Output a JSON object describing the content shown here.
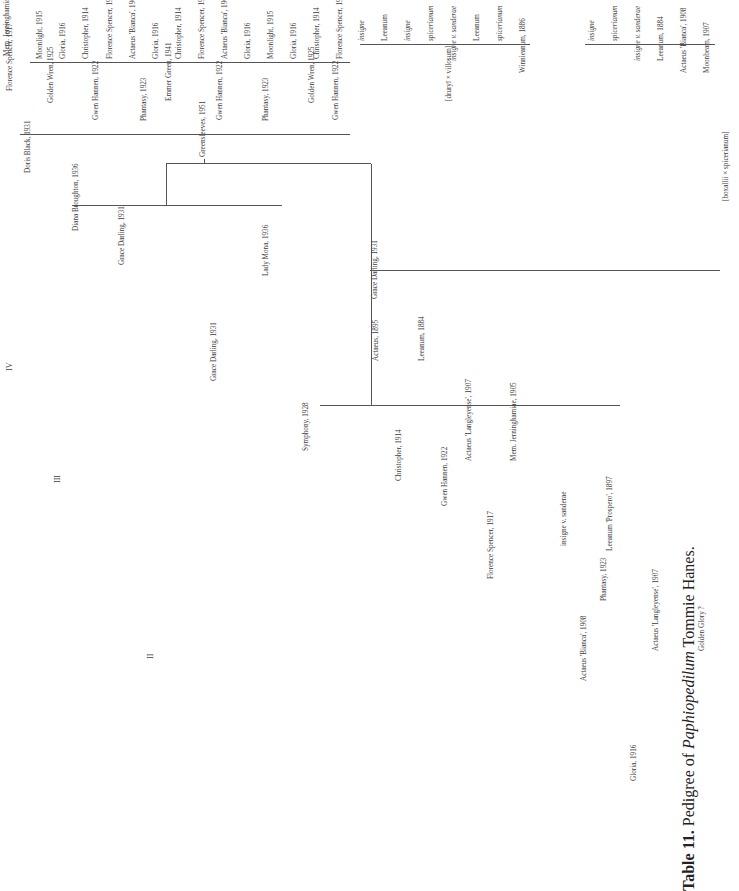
{
  "caption": {
    "label": "Table 11.",
    "text_prefix": "Pedigree of",
    "genus": "Paphiopedilum",
    "cultivar": "Tommie Hanes."
  },
  "generation_labels": [
    "II",
    "III",
    "IV"
  ],
  "tree": {
    "root": "Greensleeves, 1951",
    "gen2": [
      "Emmer Green, 1941",
      "Grace Darling, 1931"
    ],
    "gen3": [
      "Diana Broughton, 1936",
      "Lady Mona, 1936",
      "Gwen Hannen, 1922",
      "Phantasy, 1923"
    ],
    "gen4": [
      "Doris Black, 1931",
      "Grace Darling, 1931",
      "Grace Darling, 1931",
      "Symphony, 1928",
      "Christopher, 1914",
      "Florence Spencer, 1917",
      "Actaeus 'Bianca', 1908",
      "Gloria, 1916"
    ],
    "gen5": [
      "Florence Spencer, 1917",
      "Golden Wren, 1925",
      "Gwen Hannen, 1922",
      "Phantasy, 1923",
      "Gwen Hannen, 1922",
      "Phantasy, 1923",
      "Golden Wren, 1925",
      "Gwen Hannen, 1922",
      "Actaeus, 1895",
      "Leeanum, 1884",
      "Actaeus 'Langleyense', 1907",
      "Mem. Jerninghamiae, 1905",
      "insigne v. sanderae",
      "Leeanum 'Prospero', 1897",
      "Actaeus 'Langleyense', 1907",
      "Golden Glory ?"
    ],
    "gen6": [
      "Mem. Jerninghamiae, 1905",
      "Moonlight, 1915",
      "Gloria, 1916",
      "Christopher, 1914",
      "Florence Spencer, 1917",
      "Actaeus 'Bianca', 1908",
      "Gloria, 1916",
      "Christopher, 1914",
      "Florence Spencer, 1917",
      "Actaeus 'Bianca', 1908",
      "Gloria, 1916",
      "Moonlight, 1915",
      "Gloria, 1916",
      "Christopher, 1914",
      "Florence Spencer, 1917",
      "insigne",
      "Leeanum",
      "insigne",
      "spicerianum",
      "insigne v. sanderae",
      "Leeanum",
      "spicerianum",
      "Winnieanum, 1886",
      "insigne",
      "spicerianum",
      "insigne v. sanderae",
      "Leeanum, 1884",
      "Actaeus 'Bianca', 1908",
      "Moonbeam, 1907"
    ],
    "gen7_left": [
      "spicerianum",
      "Winnieanum (druryī × villosum)",
      "Actaeus (insigne × Leeanum)",
      "Moonbeam (Nitens × Thompsonii)",
      "Actaeus (insigne × Leeanum)",
      "Golden Glory (Actaeus × Moonbeam)",
      "Actaeus (insigne × Leeanum)",
      "Leeanum (insigne × spicerianum)",
      "Actaeus 'Langleyense' (insigne var. sanderae × Leeanum)",
      "Mem. Jerninghamiae (spicerianum × Winnieanum)",
      "insigne v. sanderae",
      "Leeanum",
      "Actaeus (insigne × Leeanum)",
      "Leeanum (insigne × spicerianum)",
      "Actaeus (insigne × Leeanum)",
      "Leeanum (insigne × spicerianum)",
      "Actaeus 'Langleyense' (insigne var. sanderae × Leeanum)",
      "Mem. Jerninghamiae (spicerianum × Winnieanum)",
      "insigne v. sanderae",
      "Leeanum 'Prospero' (insigne × spicerianum)",
      "Actaeus 'Langleyense' (insigne sanderae × Leeanum)",
      "Golden Glory (Actaeus 'Bianca' × Moonbeam)",
      "Actaeus (insigne × Leeanum)",
      "Moonbeam (Nitens × Thompsonii)",
      "Actaeus 'Langleyense' (insigne var. sanderae × Leeanum)",
      "Golden Glory (Actaeus 'Bianca' × Moonbeam)",
      "Actaeus (insigne × Leeanum)",
      "Leeanum (insigne × spicerianum)",
      "Actaeus 'Langleyense' (insigne × Leeanum)",
      "Mem. Jerninghamiae (spicerianum × Winnieanum)"
    ],
    "gen7_right": [
      "insigne",
      "spicerianum",
      "insigne",
      "spicerianum",
      "druryī",
      "villosum",
      "insigne v. sanderae",
      "spicerianum",
      "insigne",
      "spicerianum",
      "insigne v. sanderae",
      "Leeanum 'Prospero' (insigne × spicerianum)",
      "Nitens 'Sallieri Hyeanum' (insigne × villosum)",
      "Thompsonii (Calypso × villosum)"
    ],
    "footnotes": [
      "[druryī × villosum]",
      "[boxallii × spicerianum]"
    ]
  }
}
